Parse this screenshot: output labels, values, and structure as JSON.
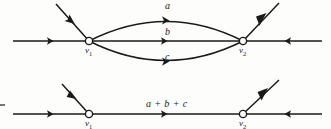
{
  "figure": {
    "background_color": "#fdfdfb",
    "stroke_color": "#1a1a1a",
    "node_fill_color": "#ffffff"
  },
  "top_diagram": {
    "nodes": [
      {
        "id": "v1",
        "label": "v",
        "subscript": "1",
        "x": 89,
        "y": 41
      },
      {
        "id": "v2",
        "label": "v",
        "subscript": "2",
        "x": 243,
        "y": 41
      }
    ],
    "edges": [
      {
        "id": "edge-a",
        "label": "a",
        "curve": "upper",
        "direction": "right"
      },
      {
        "id": "edge-b",
        "label": "b",
        "curve": "straight",
        "direction": "right"
      },
      {
        "id": "edge-c",
        "label": "c",
        "curve": "lower",
        "direction": "right"
      }
    ],
    "incident_rays": [
      {
        "id": "left-horizontal-ray",
        "direction": "right"
      },
      {
        "id": "left-diagonal-ray",
        "direction": "up-left"
      },
      {
        "id": "right-horizontal-ray",
        "direction": "left"
      },
      {
        "id": "right-diagonal-ray",
        "direction": "up-right"
      }
    ]
  },
  "bottom_diagram": {
    "nodes": [
      {
        "id": "v1",
        "label": "v",
        "subscript": "1",
        "x": 89,
        "y": 114
      },
      {
        "id": "v2",
        "label": "v",
        "subscript": "2",
        "x": 243,
        "y": 114
      }
    ],
    "edges": [
      {
        "id": "edge-sum",
        "label": "a + b + c",
        "curve": "straight",
        "direction": "right"
      }
    ],
    "incident_rays": [
      {
        "id": "left-horizontal-ray",
        "direction": "right"
      },
      {
        "id": "left-diagonal-ray",
        "direction": "up-left"
      },
      {
        "id": "right-horizontal-ray",
        "direction": "left"
      },
      {
        "id": "right-diagonal-ray",
        "direction": "up-right"
      }
    ]
  },
  "margin_mark": {
    "id": "left-margin-tick",
    "visible": true
  }
}
